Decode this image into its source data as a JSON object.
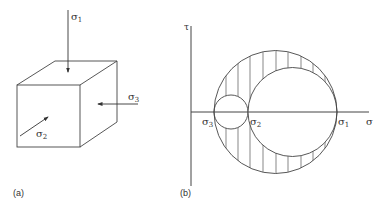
{
  "panels": [
    {
      "caption": "(a)",
      "kind": "stressed-cube",
      "arrows": [
        {
          "label_base": "σ",
          "label_sub": "1",
          "direction": "downward onto top face"
        },
        {
          "label_base": "σ",
          "label_sub": "2",
          "direction": "into front face"
        },
        {
          "label_base": "σ",
          "label_sub": "3",
          "direction": "leftward onto side face"
        }
      ]
    },
    {
      "caption": "(b)",
      "kind": "mohr-circles",
      "axes": {
        "x_label": "σ",
        "y_label": "τ"
      },
      "points": [
        {
          "label_base": "σ",
          "label_sub": "3"
        },
        {
          "label_base": "σ",
          "label_sub": "2"
        },
        {
          "label_base": "σ",
          "label_sub": "1"
        }
      ],
      "circles": [
        "σ3–σ2",
        "σ2–σ1",
        "σ3–σ1"
      ],
      "shaded_region": "between large circle and two inner circles (vertical hatching)"
    }
  ],
  "colors": {
    "stroke": "#444444",
    "text": "#333333"
  }
}
